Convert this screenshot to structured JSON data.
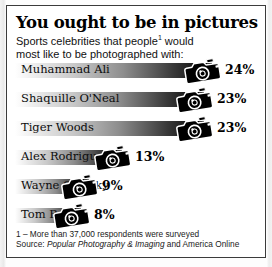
{
  "panel": {
    "title": "You ought to be in pictures",
    "subtitle_line1": "Sports celebrities that people",
    "subtitle_footnote_marker": "1",
    "subtitle_line1_end": " would",
    "subtitle_line2": "most like to be photographed with:"
  },
  "footer": {
    "footnote": "1 – More than 37,000 respondents were surveyed",
    "source_prefix": "Source: ",
    "source_italic": "Popular Photography & Imaging",
    "source_suffix": " and America Online"
  },
  "icons": {
    "camera": "camera-icon",
    "starburst": "flash-starburst-icon"
  },
  "colors": {
    "bar_dark": "#000000",
    "bar_light": "#ffffff",
    "text": "#0d0d0d",
    "panel_border": "#3b3b3b",
    "background": "#ffffff"
  },
  "chart_data": {
    "type": "bar",
    "orientation": "horizontal",
    "title": "You ought to be in pictures",
    "subtitle": "Sports celebrities that people¹ would most like to be photographed with:",
    "xlabel": "",
    "ylabel": "",
    "xlim": [
      0,
      26
    ],
    "grid": false,
    "legend": false,
    "unit": "%",
    "categories": [
      "Muhammad Ali",
      "Shaquille O'Neal",
      "Tiger Woods",
      "Alex Rodriguez",
      "Wayne Gretzky",
      "Tom Brady"
    ],
    "values": [
      24,
      23,
      23,
      13,
      9,
      8
    ],
    "value_labels": [
      "24%",
      "23%",
      "23%",
      "13%",
      "9%",
      "8%"
    ],
    "source": "Popular Photography & Imaging and America Online",
    "note": "1 – More than 37,000 respondents were surveyed"
  }
}
